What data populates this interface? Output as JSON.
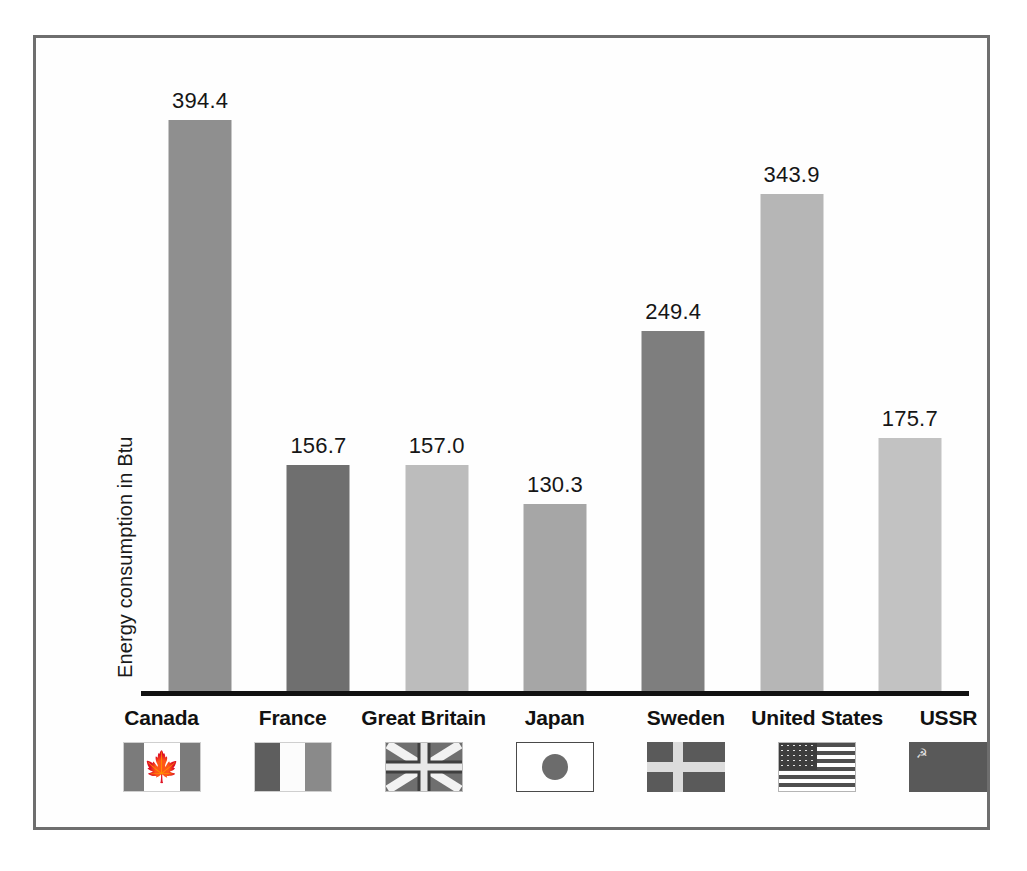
{
  "chart_data": {
    "type": "bar",
    "title": "",
    "xlabel": "",
    "ylabel": "Energy consumption in Btu",
    "ylim": [
      0,
      420
    ],
    "grid": false,
    "legend": "none",
    "categories": [
      "Canada",
      "France",
      "Great Britain",
      "Japan",
      "Sweden",
      "United States",
      "USSR"
    ],
    "values": [
      394.4,
      156.7,
      157.0,
      130.3,
      249.4,
      343.9,
      175.7
    ],
    "value_labels": [
      "394.4",
      "156.7",
      "157.0",
      "130.3",
      "249.4",
      "343.9",
      "175.7"
    ],
    "bar_colors": [
      "#8f8f8f",
      "#6f6f6f",
      "#bcbcbc",
      "#a6a6a6",
      "#7e7e7e",
      "#b6b6b6",
      "#c2c2c2"
    ],
    "icons": [
      "flag-canada-icon",
      "flag-france-icon",
      "flag-great-britain-icon",
      "flag-japan-icon",
      "flag-sweden-icon",
      "flag-united-states-icon",
      "flag-ussr-icon"
    ]
  },
  "frame": {
    "border_color": "#6e6e6e",
    "background_color": "#fefefe"
  },
  "axis": {
    "baseline_color": "#111111"
  }
}
